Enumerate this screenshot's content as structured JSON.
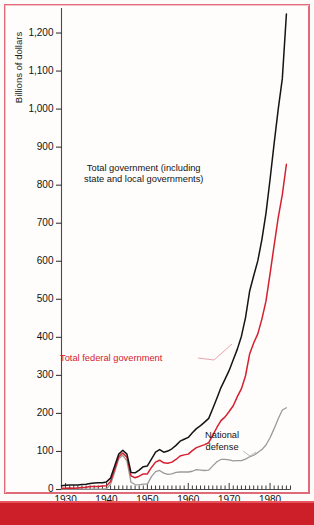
{
  "chart_data": {
    "type": "line",
    "title": "",
    "xlabel": "",
    "ylabel": "Billions of dollars",
    "xlim": [
      1929,
      1985
    ],
    "ylim": [
      0,
      1250
    ],
    "grid": false,
    "legend_position": "inline-annotations",
    "ytick_labels": [
      "1,200",
      "1,100",
      "1,000",
      "900",
      "800",
      "700",
      "600",
      "500",
      "400",
      "300",
      "200",
      "100",
      "0"
    ],
    "ytick_values": [
      1200,
      1100,
      1000,
      900,
      800,
      700,
      600,
      500,
      400,
      300,
      200,
      100,
      0
    ],
    "xtick_labels": [
      "1930",
      "1940",
      "1950",
      "1960",
      "1970",
      "1980"
    ],
    "xtick_values": [
      1930,
      1940,
      1950,
      1960,
      1970,
      1980
    ],
    "minor_tick_interval": 1,
    "series": [
      {
        "name": "Total government (including state and local governments)",
        "color": "#141414",
        "annotation": "Total government (including\nstate and local governments)",
        "x": [
          1929,
          1930,
          1931,
          1932,
          1933,
          1934,
          1935,
          1936,
          1937,
          1938,
          1939,
          1940,
          1941,
          1942,
          1943,
          1944,
          1945,
          1946,
          1947,
          1948,
          1949,
          1950,
          1951,
          1952,
          1953,
          1954,
          1955,
          1956,
          1957,
          1958,
          1959,
          1960,
          1961,
          1962,
          1963,
          1964,
          1965,
          1966,
          1967,
          1968,
          1969,
          1970,
          1971,
          1972,
          1973,
          1974,
          1975,
          1976,
          1977,
          1978,
          1979,
          1980,
          1981,
          1982,
          1983,
          1984
        ],
        "values": [
          10,
          11,
          12,
          12,
          12,
          13,
          14,
          16,
          17,
          18,
          18,
          20,
          30,
          62,
          93,
          103,
          93,
          45,
          44,
          51,
          60,
          62,
          80,
          98,
          105,
          98,
          101,
          107,
          116,
          127,
          132,
          137,
          149,
          160,
          168,
          177,
          187,
          213,
          240,
          268,
          290,
          313,
          341,
          369,
          403,
          452,
          521,
          562,
          601,
          657,
          726,
          815,
          910,
          1000,
          1080,
          1250
        ]
      },
      {
        "name": "Total federal government",
        "color": "#d4202f",
        "annotation": "Total federal government",
        "x": [
          1929,
          1930,
          1931,
          1932,
          1933,
          1934,
          1935,
          1936,
          1937,
          1938,
          1939,
          1940,
          1941,
          1942,
          1943,
          1944,
          1945,
          1946,
          1947,
          1948,
          1949,
          1950,
          1951,
          1952,
          1953,
          1954,
          1955,
          1956,
          1957,
          1958,
          1959,
          1960,
          1961,
          1962,
          1963,
          1964,
          1965,
          1966,
          1967,
          1968,
          1969,
          1970,
          1971,
          1972,
          1973,
          1974,
          1975,
          1976,
          1977,
          1978,
          1979,
          1980,
          1981,
          1982,
          1983,
          1984
        ],
        "values": [
          3,
          3,
          4,
          3,
          4,
          5,
          6,
          8,
          8,
          8,
          9,
          10,
          21,
          53,
          86,
          96,
          85,
          36,
          31,
          35,
          41,
          41,
          58,
          72,
          77,
          70,
          69,
          72,
          79,
          88,
          91,
          93,
          102,
          110,
          114,
          118,
          123,
          143,
          163,
          181,
          191,
          205,
          220,
          244,
          265,
          299,
          356,
          385,
          409,
          448,
          495,
          567,
          642,
          715,
          775,
          855
        ]
      },
      {
        "name": "National defense",
        "color": "#9a9a9a",
        "annotation": "National\ndefense",
        "x": [
          1929,
          1930,
          1931,
          1932,
          1933,
          1934,
          1935,
          1936,
          1937,
          1938,
          1939,
          1940,
          1941,
          1942,
          1943,
          1944,
          1945,
          1946,
          1947,
          1948,
          1949,
          1950,
          1951,
          1952,
          1953,
          1954,
          1955,
          1956,
          1957,
          1958,
          1959,
          1960,
          1961,
          1962,
          1963,
          1964,
          1965,
          1966,
          1967,
          1968,
          1969,
          1970,
          1971,
          1972,
          1973,
          1974,
          1975,
          1976,
          1977,
          1978,
          1979,
          1980,
          1981,
          1982,
          1983,
          1984
        ],
        "values": [
          1,
          1,
          1,
          1,
          1,
          1,
          1,
          1,
          1,
          1,
          1,
          2,
          14,
          46,
          81,
          90,
          75,
          19,
          13,
          12,
          14,
          14,
          34,
          47,
          50,
          43,
          40,
          41,
          45,
          46,
          46,
          46,
          48,
          52,
          51,
          50,
          51,
          62,
          73,
          79,
          79,
          78,
          75,
          76,
          76,
          80,
          86,
          90,
          97,
          105,
          117,
          136,
          160,
          186,
          209,
          215
        ]
      }
    ]
  },
  "frame": {
    "border_color": "#e06a78",
    "footer_bar_color": "#cc1f2a"
  }
}
